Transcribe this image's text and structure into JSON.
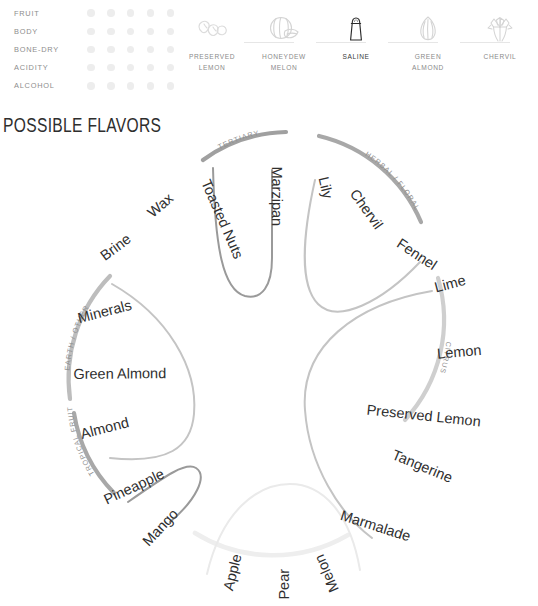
{
  "attributes": {
    "dots_per_row": 5,
    "rows": [
      {
        "label": "FRUIT",
        "filled": 0
      },
      {
        "label": "BODY",
        "filled": 0
      },
      {
        "label": "BONE-DRY",
        "filled": 0
      },
      {
        "label": "ACIDITY",
        "filled": 0
      },
      {
        "label": "ALCOHOL",
        "filled": 0
      }
    ]
  },
  "tasting_notes": [
    {
      "name": "PRESERVED\nLEMON",
      "icon": "preserved-lemon-icon",
      "active": false
    },
    {
      "name": "HONEYDEW\nMELON",
      "icon": "honeydew-melon-icon",
      "active": false
    },
    {
      "name": "SALINE",
      "icon": "saline-salt-shaker-icon",
      "active": true
    },
    {
      "name": "GREEN\nALMOND",
      "icon": "green-almond-icon",
      "active": false
    },
    {
      "name": "CHERVIL",
      "icon": "chervil-icon",
      "active": false
    }
  ],
  "section": {
    "title": "POSSIBLE FLAVORS"
  },
  "wheel": {
    "categories": [
      {
        "id": "tertiary",
        "label": "TERTIARY",
        "flavors": [
          "Toasted Nuts",
          "Marzipan"
        ]
      },
      {
        "id": "herbal-floral",
        "label": "HERBAL / FLORAL",
        "flavors": [
          "Lily",
          "Chervil",
          "Fennel"
        ]
      },
      {
        "id": "citrus",
        "label": "CITRUS",
        "flavors": [
          "Lime",
          "Lemon",
          "Preserved Lemon",
          "Tangerine",
          "Marmalade"
        ]
      },
      {
        "id": "orchard",
        "label": "",
        "flavors": [
          "Melon",
          "Pear",
          "Apple"
        ]
      },
      {
        "id": "tropical-fruit",
        "label": "TROPICAL FRUIT",
        "flavors": [
          "Mango",
          "Pineapple"
        ]
      },
      {
        "id": "earth-other",
        "label": "EARTH / OTHER",
        "flavors": [
          "Almond",
          "Green Almond",
          "Minerals",
          "Brine",
          "Wax"
        ]
      }
    ],
    "labels": {
      "tertiary": "TERTIARY",
      "herbal_floral": "HERBAL / FLORAL",
      "citrus": "CITRUS",
      "tropical_fruit": "TROPICAL FRUIT",
      "earth_other": "EARTH / OTHER",
      "toasted_nuts": "Toasted Nuts",
      "marzipan": "Marzipan",
      "lily": "Lily",
      "chervil": "Chervil",
      "fennel": "Fennel",
      "lime": "Lime",
      "lemon": "Lemon",
      "preserved_lemon": "Preserved Lemon",
      "tangerine": "Tangerine",
      "marmalade": "Marmalade",
      "melon": "Melon",
      "pear": "Pear",
      "apple": "Apple",
      "mango": "Mango",
      "pineapple": "Pineapple",
      "almond": "Almond",
      "green_almond": "Green Almond",
      "minerals": "Minerals",
      "brine": "Brine",
      "wax": "Wax"
    }
  },
  "colors": {
    "dot": "#ededed",
    "arc_outer": "#a8a8a8",
    "arc_inner": "#c9c9c9",
    "arc_faint": "#ececec",
    "text_dark": "#2f2f2f",
    "text_muted": "#8d8d8d",
    "icon_line": "#d8d8d8",
    "icon_active": "#2b2b2b"
  }
}
